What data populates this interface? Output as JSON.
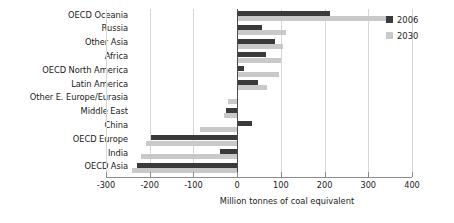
{
  "chart_data": {
    "type": "bar",
    "orientation": "horizontal",
    "title": "",
    "subtitle": "",
    "xlabel": "Million tonnes of coal equivalent",
    "ylabel": "",
    "xlim": [
      -300,
      400
    ],
    "xticks": [
      -300,
      -200,
      -100,
      0,
      100,
      200,
      300,
      400
    ],
    "xtick_labels": [
      "-300",
      "-200",
      "-100",
      "0",
      "100",
      "200",
      "300",
      "400"
    ],
    "grid": true,
    "grid_axis": "x",
    "legend_position": "top-right",
    "categories": [
      "OECD Oceania",
      "Russia",
      "Other Asia",
      "Africa",
      "OECD North America",
      "Latin America",
      "Other E. Europe/Eurasia",
      "Middle East",
      "China",
      "OECD Europe",
      "India",
      "OECD Asia"
    ],
    "series": [
      {
        "name": "2006",
        "color": "#3a3a3a",
        "values": [
          212,
          57,
          87,
          66,
          16,
          48,
          0,
          -25,
          34,
          -196,
          -39,
          -229
        ]
      },
      {
        "name": "2030",
        "color": "#c9c9c9",
        "values": [
          345,
          112,
          105,
          100,
          96,
          69,
          -20,
          -30,
          -85,
          -208,
          -220,
          -240
        ]
      }
    ]
  },
  "legend": {
    "entries": [
      {
        "label": "2006",
        "color": "#3a3a3a"
      },
      {
        "label": "2030",
        "color": "#c9c9c9"
      }
    ]
  },
  "axis": {
    "x_title": "Million tonnes of coal equivalent"
  }
}
